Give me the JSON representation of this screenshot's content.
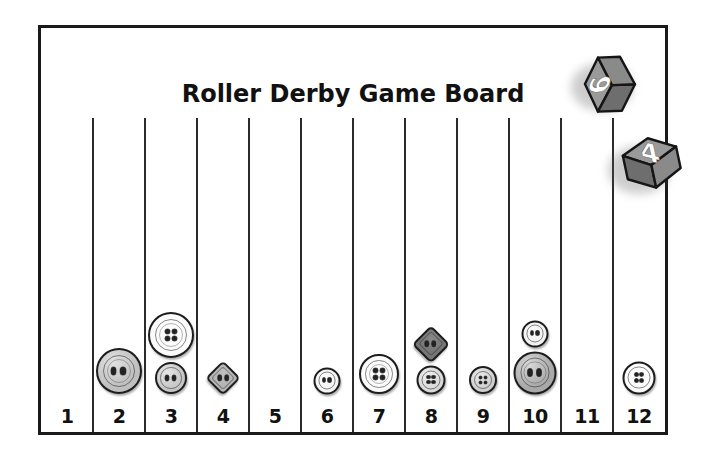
{
  "board": {
    "title": "Roller Derby Game Board",
    "lane_count": 12,
    "lane_labels": [
      "1",
      "2",
      "3",
      "4",
      "5",
      "6",
      "7",
      "8",
      "9",
      "10",
      "11",
      "12"
    ],
    "border_color": "#1a1a1a",
    "lane_line_color": "#2b2b2b",
    "background_color": "#ffffff",
    "label_color": "#111111"
  },
  "dice": [
    {
      "name": "die-six",
      "value": "6",
      "face_color": "#8a8a8a",
      "side_color": "#6e6e6e",
      "top_color": "#9a9a9a",
      "number_color": "#ffffff",
      "x": 575,
      "y": 45,
      "rotation": -92
    },
    {
      "name": "die-four",
      "value": "4",
      "face_color": "#8a8a8a",
      "side_color": "#6e6e6e",
      "top_color": "#9a9a9a",
      "number_color": "#ffffff",
      "x": 612,
      "y": 128,
      "rotation": -12
    }
  ],
  "pieces": [
    {
      "lane": 2,
      "shape": "round",
      "size": 46,
      "holes": 2,
      "color": "#bfbfbf",
      "rings": 2,
      "stack": 0,
      "label": "large-gray-two-hole-button"
    },
    {
      "lane": 3,
      "shape": "round",
      "size": 46,
      "holes": 4,
      "color": "#fbfbfb",
      "rings": 2,
      "stack": 1,
      "label": "large-white-four-hole-button"
    },
    {
      "lane": 3,
      "shape": "round",
      "size": 32,
      "holes": 2,
      "color": "#c6c6c6",
      "rings": 1,
      "stack": 0,
      "label": "small-gray-two-hole-button"
    },
    {
      "lane": 4,
      "shape": "diamond",
      "size": 32,
      "holes": 2,
      "color": "#b5b5b5",
      "rings": 1,
      "stack": 0,
      "label": "gray-diamond-two-hole-button"
    },
    {
      "lane": 6,
      "shape": "round",
      "size": 27,
      "holes": 2,
      "color": "#f4f4f4",
      "rings": 1,
      "stack": 0,
      "label": "small-white-two-hole-button"
    },
    {
      "lane": 7,
      "shape": "round",
      "size": 40,
      "holes": 4,
      "color": "#fbfbfb",
      "rings": 2,
      "stack": 0,
      "label": "white-four-hole-button"
    },
    {
      "lane": 8,
      "shape": "diamond",
      "size": 34,
      "holes": 2,
      "color": "#767676",
      "rings": 1,
      "stack": 1,
      "label": "dark-gray-diamond-two-hole-button"
    },
    {
      "lane": 8,
      "shape": "round",
      "size": 29,
      "holes": 4,
      "color": "#d8d8d8",
      "rings": 1,
      "stack": 0,
      "label": "small-gray-four-hole-button"
    },
    {
      "lane": 9,
      "shape": "round",
      "size": 28,
      "holes": 4,
      "color": "#cfcfcf",
      "rings": 1,
      "stack": 0,
      "label": "small-gray-four-hole-button"
    },
    {
      "lane": 10,
      "shape": "round",
      "size": 27,
      "holes": 2,
      "color": "#f2f2f2",
      "rings": 1,
      "stack": 1,
      "label": "small-white-two-hole-button"
    },
    {
      "lane": 10,
      "shape": "round",
      "size": 43,
      "holes": 2,
      "color": "#a8a8a8",
      "rings": 2,
      "stack": 0,
      "label": "large-gray-two-hole-button"
    },
    {
      "lane": 12,
      "shape": "round",
      "size": 33,
      "holes": 4,
      "color": "#fbfbfb",
      "rings": 1,
      "stack": 0,
      "label": "white-four-hole-button"
    }
  ]
}
